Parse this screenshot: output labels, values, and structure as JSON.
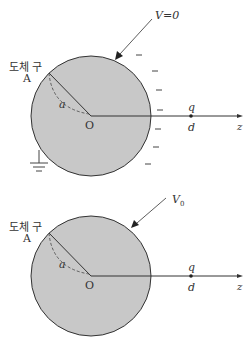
{
  "panels": [
    {
      "name": "grounded",
      "sphere_label": "도체 구",
      "sphere_letter": "A",
      "potential_label": "V=0",
      "radius_label": "a",
      "origin_label": "O",
      "charge_label": "q",
      "distance_label": "d",
      "axis_label": "z",
      "induced_charges": [
        "−",
        "−",
        "−",
        "−",
        "−",
        "−",
        "−"
      ],
      "grounded": true
    },
    {
      "name": "fixed-potential",
      "sphere_label": "도체 구",
      "sphere_letter": "A",
      "potential_label": "V",
      "potential_subscript": "0",
      "radius_label": "a",
      "origin_label": "O",
      "charge_label": "q",
      "distance_label": "d",
      "axis_label": "z",
      "grounded": false
    }
  ],
  "colors": {
    "sphere_fill": "#c8c8c8",
    "stroke": "#333333"
  }
}
